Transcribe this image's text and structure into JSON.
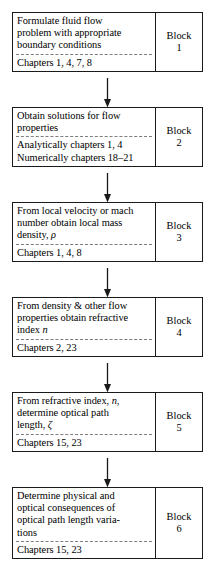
{
  "diagram": {
    "type": "flowchart",
    "orientation": "vertical",
    "line_color": "#1a1a1a",
    "divider_color": "#7d7d7d",
    "background": "#ffffff",
    "connector_name": "down-arrow-icon",
    "blocks": [
      {
        "id": "block-1",
        "desc_lines": [
          "Formulate fluid flow",
          "problem with appropriate",
          "boundary conditions"
        ],
        "chapters_lines": [
          "Chapters 1, 4, 7, 8"
        ],
        "label": "Block",
        "number": "1"
      },
      {
        "id": "block-2",
        "desc_lines": [
          "Obtain solutions for flow",
          "properties"
        ],
        "chapters_lines": [
          "Analytically chapters 1, 4",
          "Numerically chapters 18–21"
        ],
        "label": "Block",
        "number": "2"
      },
      {
        "id": "block-3",
        "desc_lines": [
          "From local velocity or mach",
          "number obtain local mass",
          "density, ρ"
        ],
        "chapters_lines": [
          "Chapters 1, 4, 8"
        ],
        "label": "Block",
        "number": "3"
      },
      {
        "id": "block-4",
        "desc_lines": [
          "From density & other flow",
          "properties obtain refractive",
          "index n"
        ],
        "chapters_lines": [
          "Chapters 2, 23"
        ],
        "label": "Block",
        "number": "4"
      },
      {
        "id": "block-5",
        "desc_lines": [
          "From refractive index, n,",
          "determine optical path",
          "length, ζ"
        ],
        "chapters_lines": [
          "Chapters 15, 23"
        ],
        "label": "Block",
        "number": "5"
      },
      {
        "id": "block-6",
        "desc_lines": [
          "Determine physical and",
          "optical consequences of",
          "optical path length varia-",
          "tions"
        ],
        "chapters_lines": [
          "Chapters 15, 23"
        ],
        "label": "Block",
        "number": "6"
      }
    ]
  }
}
